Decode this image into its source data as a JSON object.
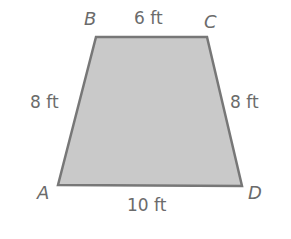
{
  "figure": {
    "shape": "trapezoid",
    "fill_color": "#c9c9c9",
    "stroke_color": "#777777",
    "text_color": "#6b6b6b",
    "vertices": [
      {
        "name": "A",
        "x": 58,
        "y": 185
      },
      {
        "name": "B",
        "x": 96,
        "y": 37
      },
      {
        "name": "C",
        "x": 207,
        "y": 37
      },
      {
        "name": "D",
        "x": 242,
        "y": 186
      }
    ],
    "vertex_labels": {
      "A": "A",
      "B": "B",
      "C": "C",
      "D": "D"
    },
    "side_labels": {
      "BC": "6 ft",
      "AB": "8 ft",
      "CD": "8 ft",
      "AD": "10 ft"
    }
  }
}
